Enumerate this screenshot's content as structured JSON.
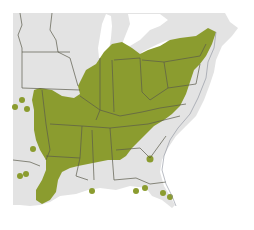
{
  "map": {
    "title": "",
    "region": "Eastern United States",
    "colors": {
      "land": "#e3e3e3",
      "range": "#8b9c2f",
      "water": "#ffffff",
      "border": "#5a5a4a"
    },
    "legend": [],
    "features": {
      "range_area": "Contiguous green distribution covering the Ohio Valley, Mid-Atlantic and Southeast interior",
      "outlier_dots_west": 4,
      "outlier_dots_gulf": 3,
      "outlier_dots_florida": 5
    }
  }
}
